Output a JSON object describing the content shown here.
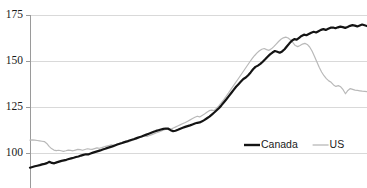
{
  "chart_data": {
    "type": "line",
    "title": "",
    "subtitle": "",
    "xlabel": "",
    "ylabel": "",
    "ylim": [
      85,
      175
    ],
    "yticks": [
      100,
      125,
      150,
      175
    ],
    "ytick_labels": [
      "100",
      "125",
      "150",
      "175"
    ],
    "grid": true,
    "xaxis_labels_visible": false,
    "legend_position": "inside-bottom-right",
    "colors": {
      "canada": "#141414",
      "us": "#b9b9b9",
      "gridline": "#d9d9d9",
      "axis": "#9a9a9a",
      "background": "#ffffff",
      "text": "#1a1a1a"
    },
    "series": [
      {
        "name": "Canada",
        "color": "#141414",
        "width": "thick",
        "values": [
          92.0,
          92.4,
          92.8,
          93.1,
          93.4,
          93.8,
          94.1,
          94.5,
          95.2,
          94.6,
          94.4,
          94.9,
          95.3,
          95.7,
          96.0,
          96.3,
          96.7,
          97.1,
          97.4,
          97.8,
          98.1,
          98.6,
          99.0,
          99.3,
          99.2,
          99.7,
          100.2,
          100.6,
          101.0,
          101.4,
          101.9,
          102.3,
          102.8,
          103.2,
          103.6,
          104.1,
          104.6,
          105.0,
          105.4,
          105.9,
          106.3,
          106.8,
          107.2,
          107.6,
          108.1,
          108.6,
          109.0,
          109.5,
          110.0,
          110.5,
          111.0,
          111.5,
          112.0,
          112.4,
          112.8,
          113.1,
          113.3,
          113.2,
          112.4,
          111.9,
          112.1,
          112.6,
          113.2,
          113.7,
          114.2,
          114.6,
          115.0,
          115.5,
          116.0,
          116.4,
          116.6,
          117.2,
          118.0,
          118.9,
          119.8,
          120.9,
          122.0,
          123.2,
          124.5,
          126.0,
          127.6,
          129.2,
          130.9,
          132.6,
          134.3,
          136.0,
          137.4,
          138.8,
          140.2,
          141.0,
          142.3,
          143.8,
          145.5,
          146.8,
          147.5,
          148.4,
          149.6,
          150.9,
          152.3,
          153.6,
          154.6,
          155.4,
          155.0,
          154.5,
          155.2,
          156.4,
          158.0,
          159.6,
          161.0,
          161.9,
          161.6,
          162.6,
          163.6,
          164.3,
          164.0,
          164.7,
          165.4,
          165.9,
          165.5,
          166.2,
          166.9,
          167.3,
          166.9,
          167.5,
          168.1,
          168.2,
          167.8,
          168.3,
          168.7,
          168.4,
          168.0,
          168.5,
          169.1,
          169.5,
          169.2,
          168.8,
          169.3,
          169.8,
          169.4,
          169.0
        ]
      },
      {
        "name": "US",
        "color": "#b9b9b9",
        "width": "thin",
        "values": [
          107.0,
          107.1,
          107.0,
          106.8,
          106.6,
          106.4,
          106.2,
          105.2,
          103.6,
          102.4,
          101.6,
          101.3,
          101.5,
          101.2,
          100.9,
          101.2,
          101.6,
          101.4,
          101.2,
          101.6,
          102.0,
          101.8,
          101.5,
          101.9,
          102.3,
          102.1,
          102.0,
          102.4,
          102.8,
          102.6,
          102.9,
          103.3,
          103.7,
          104.1,
          104.4,
          104.2,
          104.6,
          105.1,
          105.5,
          105.9,
          106.3,
          106.0,
          106.4,
          106.9,
          107.4,
          107.9,
          108.4,
          108.9,
          109.3,
          109.0,
          109.5,
          110.0,
          110.5,
          111.0,
          111.5,
          112.0,
          112.5,
          113.0,
          113.4,
          113.0,
          113.6,
          114.2,
          114.8,
          115.4,
          116.0,
          116.6,
          117.3,
          118.0,
          118.7,
          119.4,
          120.0,
          119.6,
          120.4,
          121.2,
          122.1,
          123.0,
          123.3,
          123.0,
          124.2,
          125.6,
          127.2,
          128.9,
          130.7,
          132.5,
          134.4,
          136.3,
          138.2,
          140.1,
          142.0,
          143.9,
          145.8,
          147.7,
          149.6,
          151.4,
          153.0,
          154.4,
          155.6,
          156.4,
          156.8,
          156.2,
          155.8,
          156.6,
          157.8,
          159.2,
          160.6,
          161.8,
          162.6,
          163.0,
          162.5,
          161.4,
          160.0,
          158.4,
          157.8,
          158.4,
          159.2,
          159.6,
          159.0,
          157.6,
          155.4,
          152.6,
          149.6,
          146.6,
          144.0,
          142.0,
          140.4,
          139.2,
          138.4,
          137.0,
          136.2,
          136.6,
          136.0,
          134.4,
          132.2,
          134.0,
          135.0,
          134.6,
          134.2,
          134.0,
          133.8,
          133.6,
          133.5,
          133.4
        ]
      }
    ]
  },
  "legend": {
    "items": [
      {
        "label": "Canada",
        "color": "#141414",
        "style": "thick"
      },
      {
        "label": "US",
        "color": "#b9b9b9",
        "style": "thin"
      }
    ]
  }
}
